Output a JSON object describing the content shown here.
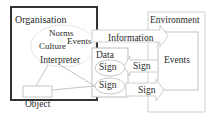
{
  "diagram": {
    "organisation": {
      "label": "Organisation"
    },
    "environment": {
      "label": "Environment",
      "events_label": "Events"
    },
    "culture_ellipse": {
      "norms": "Norms",
      "events": "Events",
      "culture": "Culture"
    },
    "interpreter": "Interpreter",
    "object": "Object",
    "data_box": {
      "label": "Data",
      "sign_top": "Sign",
      "sign_bottom": "Sign"
    },
    "arrows": {
      "information": "Information",
      "sign_in": "Sign",
      "sign_out": "Sign"
    }
  },
  "colors": {
    "thick_border": "#333333",
    "light_border": "#c8c8c8",
    "text": "#2a2a2a"
  }
}
